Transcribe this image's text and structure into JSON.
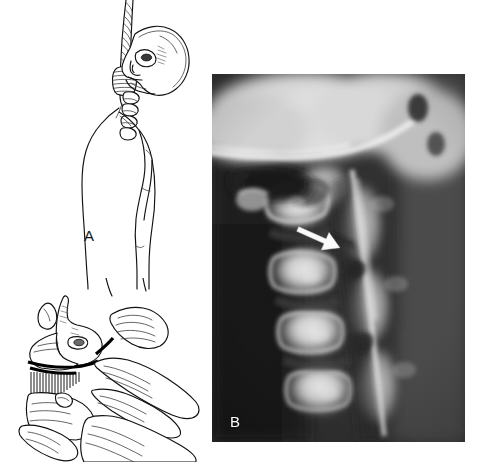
{
  "figure": {
    "kind": "medical-figure",
    "caption_text": "",
    "background_color": "#ffffff",
    "width": 481,
    "height": 462
  },
  "panels": [
    {
      "id": "A",
      "label": "A",
      "type": "line-drawing",
      "subject": "hanging victim with noose, head hyperextended",
      "elements": [
        "rope",
        "noose-knot",
        "skull-profile",
        "cervical-spine",
        "torso-profile",
        "arm"
      ]
    },
    {
      "id": "B",
      "label": "B",
      "type": "radiograph",
      "subject": "lateral cervical spine radiograph",
      "marker": "white-arrow",
      "marker_direction": "down-right",
      "tone_dark": "#1c1c1c",
      "tone_mid": "#7a7a7a",
      "tone_bright": "#efefef"
    },
    {
      "id": "C",
      "label": "C",
      "type": "line-drawing",
      "subject": "cervical vertebrae with C2 fracture",
      "elements": [
        "axis-vertebra",
        "fracture-line",
        "fracture-hatching",
        "lower-cervical-vertebrae"
      ]
    }
  ],
  "labels": {
    "a": "A",
    "b": "B",
    "c": "C"
  },
  "colors": {
    "ink": "#111111",
    "ink_light": "#555555",
    "paper": "#ffffff",
    "fracture": "#000000",
    "arrow": "#ffffff"
  }
}
